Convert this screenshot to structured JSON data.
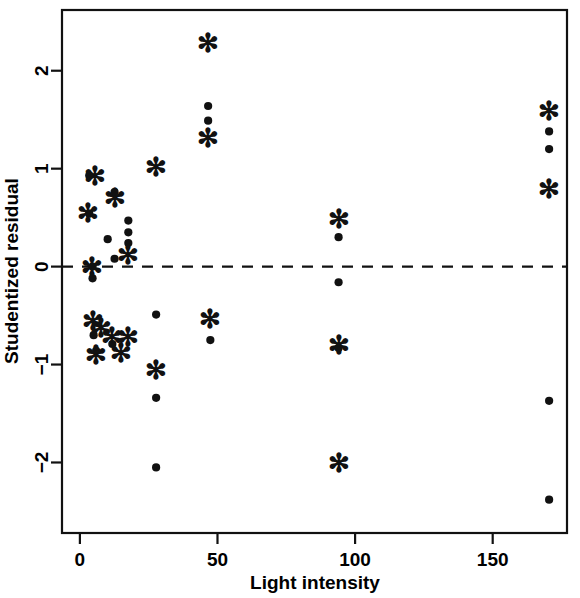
{
  "chart_data": {
    "type": "scatter",
    "title": "",
    "xlabel": "Light intensity",
    "ylabel": "Studentized residual",
    "xlim": [
      -6.5,
      177
    ],
    "ylim": [
      -2.72,
      2.62
    ],
    "grid": false,
    "legend": "none",
    "xticks": [
      0,
      50,
      100,
      150
    ],
    "xtick_labels": [
      "0",
      "50",
      "100",
      "150"
    ],
    "yticks": [
      2,
      1,
      0,
      -1,
      -2
    ],
    "ytick_labels": [
      "2",
      "1",
      "0",
      "−1",
      "−2"
    ],
    "annotations": [
      {
        "type": "hline",
        "y": 0,
        "style": "dashed",
        "label": "zero-residual-reference-line"
      }
    ],
    "series": [
      {
        "name": "dot",
        "marker": "filled-circle",
        "points": [
          {
            "x": 3.4,
            "y": 0.93
          },
          {
            "x": 3.4,
            "y": 0.54
          },
          {
            "x": 4.6,
            "y": 0.0
          },
          {
            "x": 4.6,
            "y": -0.12
          },
          {
            "x": 5.0,
            "y": -0.7
          },
          {
            "x": 5.9,
            "y": -0.86
          },
          {
            "x": 10.1,
            "y": 0.28
          },
          {
            "x": 12.6,
            "y": 0.76
          },
          {
            "x": 12.6,
            "y": 0.08
          },
          {
            "x": 11.8,
            "y": -0.79
          },
          {
            "x": 17.6,
            "y": 0.47
          },
          {
            "x": 17.6,
            "y": 0.35
          },
          {
            "x": 17.6,
            "y": 0.24
          },
          {
            "x": 27.7,
            "y": -0.49
          },
          {
            "x": 27.7,
            "y": -1.34
          },
          {
            "x": 27.7,
            "y": -2.05
          },
          {
            "x": 46.6,
            "y": 1.64
          },
          {
            "x": 46.6,
            "y": 1.49
          },
          {
            "x": 47.4,
            "y": -0.75
          },
          {
            "x": 94.0,
            "y": 0.3
          },
          {
            "x": 94.0,
            "y": -0.16
          },
          {
            "x": 94.0,
            "y": -0.83
          },
          {
            "x": 170.5,
            "y": 1.38
          },
          {
            "x": 170.5,
            "y": 1.2
          },
          {
            "x": 170.5,
            "y": -1.37
          },
          {
            "x": 170.5,
            "y": -2.38
          }
        ]
      },
      {
        "name": "star",
        "marker": "asterisk",
        "points": [
          {
            "x": 5.5,
            "y": 0.92
          },
          {
            "x": 3.0,
            "y": 0.55
          },
          {
            "x": 4.4,
            "y": 0.0
          },
          {
            "x": 4.6,
            "y": -0.56
          },
          {
            "x": 5.9,
            "y": -0.9
          },
          {
            "x": 7.6,
            "y": -0.63
          },
          {
            "x": 12.6,
            "y": 0.7
          },
          {
            "x": 11.8,
            "y": -0.72
          },
          {
            "x": 15.1,
            "y": -0.88
          },
          {
            "x": 17.6,
            "y": 0.12
          },
          {
            "x": 17.6,
            "y": -0.72
          },
          {
            "x": 27.7,
            "y": 1.02
          },
          {
            "x": 27.7,
            "y": -1.06
          },
          {
            "x": 46.6,
            "y": 2.28
          },
          {
            "x": 46.6,
            "y": 1.31
          },
          {
            "x": 47.4,
            "y": -0.53
          },
          {
            "x": 94.0,
            "y": 0.49
          },
          {
            "x": 94.0,
            "y": -0.8
          },
          {
            "x": 94.0,
            "y": -2.01
          },
          {
            "x": 170.5,
            "y": 1.59
          },
          {
            "x": 170.5,
            "y": 0.79
          }
        ]
      }
    ]
  },
  "axes": {
    "x_title": "Light intensity",
    "y_title": "Studentized residual"
  }
}
